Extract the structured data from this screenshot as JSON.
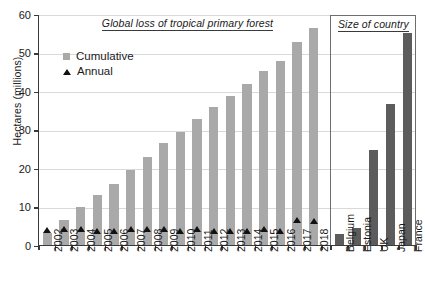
{
  "chart_data": {
    "type": "bar",
    "title": "Global loss of tropical primary forest",
    "panels": [
      {
        "name": "forest",
        "title": "Global loss of tropical primary forest",
        "categories": [
          "2002",
          "2003",
          "2004",
          "2005",
          "2006",
          "2007",
          "2008",
          "2009",
          "2010",
          "2011",
          "2012",
          "2013",
          "2014",
          "2015",
          "2016",
          "2017",
          "2018"
        ],
        "series": [
          {
            "name": "Cumulative",
            "type": "bar",
            "color": "#a9a9a9",
            "values": [
              3.2,
              6.5,
              10.0,
              13.0,
              16.0,
              19.5,
              23.0,
              26.5,
              29.5,
              33.0,
              36.0,
              39.0,
              42.0,
              45.5,
              48.0,
              53.0,
              56.5
            ]
          },
          {
            "name": "Annual",
            "type": "marker",
            "color": "#111111",
            "values": [
              3.2,
              3.3,
              3.5,
              3.0,
              3.0,
              3.5,
              3.5,
              3.5,
              3.0,
              3.5,
              3.0,
              3.0,
              3.0,
              3.5,
              3.0,
              5.8,
              5.4
            ]
          }
        ]
      },
      {
        "name": "country",
        "title": "Size of country",
        "categories": [
          "Belgium",
          "Estonia",
          "UK",
          "Japan",
          "France"
        ],
        "series": [
          {
            "name": "Size of country",
            "type": "bar",
            "color": "#5c5c5c",
            "values": [
              3.0,
              4.5,
              24.8,
              37.0,
              55.5
            ]
          }
        ]
      }
    ],
    "xlabel": "",
    "ylabel": "Hectares (millions)",
    "ylim": [
      0,
      60
    ],
    "yticks": [
      0,
      10,
      20,
      30,
      40,
      50,
      60
    ],
    "grid": true,
    "legend": {
      "position": "top-left",
      "entries": [
        {
          "label": "Cumulative",
          "marker": "square",
          "color": "#a9a9a9"
        },
        {
          "label": "Annual",
          "marker": "triangle",
          "color": "#111111"
        }
      ]
    }
  }
}
